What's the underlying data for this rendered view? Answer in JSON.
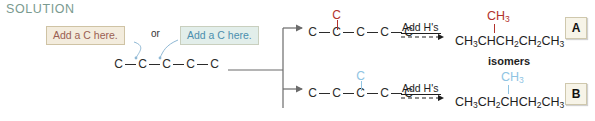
{
  "heading": {
    "label": "SOLUTION",
    "color": "#7a9a8f"
  },
  "callouts": {
    "left": {
      "text": "Add a C here.",
      "text_color": "#9a5f52",
      "background": "#f3ecdd",
      "border": "#cfc3a4"
    },
    "conjunction": "or",
    "right": {
      "text": "Add a C here.",
      "text_color": "#4b8fae",
      "background": "#e2eeea",
      "border": "#c9cfbe"
    }
  },
  "starting_material": {
    "name": "pentane-skeleton",
    "atoms": [
      "C",
      "C",
      "C",
      "C",
      "C"
    ],
    "bond_symbol": "—"
  },
  "branches": {
    "upper": {
      "chain_atoms": [
        "C",
        "C",
        "C",
        "C",
        "C"
      ],
      "substituent": "C",
      "substituent_color": "#b2322c",
      "substituent_position": 2,
      "reaction_label": "Add H's",
      "product_formula_parts": [
        {
          "text": "CH",
          "sub": "3"
        },
        {
          "text": "CH",
          "sub": ""
        },
        {
          "text": "CH",
          "sub": "2"
        },
        {
          "text": "CH",
          "sub": "2"
        },
        {
          "text": "CH",
          "sub": "3"
        }
      ],
      "product_branch": {
        "text": "CH",
        "sub": "3",
        "color": "#b2322c"
      },
      "tag": "A"
    },
    "lower": {
      "chain_atoms": [
        "C",
        "C",
        "C",
        "C",
        "C"
      ],
      "substituent": "C",
      "substituent_color": "#8fc4e3",
      "substituent_position": 3,
      "reaction_label": "Add H's",
      "product_formula_parts": [
        {
          "text": "CH",
          "sub": "3"
        },
        {
          "text": "CH",
          "sub": "2"
        },
        {
          "text": "CH",
          "sub": ""
        },
        {
          "text": "CH",
          "sub": "2"
        },
        {
          "text": "CH",
          "sub": "3"
        }
      ],
      "product_branch": {
        "text": "CH",
        "sub": "3",
        "color": "#8fc4e3"
      },
      "tag": "B"
    }
  },
  "relationship_note": "isomers"
}
